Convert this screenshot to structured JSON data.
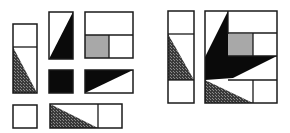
{
  "colors": {
    "background": "#ffffff",
    "stroke": "#1a1a1a",
    "black": "#0a0a0a",
    "gray": "#a8a8a8",
    "hatch_dark": "#3a3a3a",
    "hatch_light": "#8a8a8a"
  },
  "left_panel": {
    "label": "puzzle-pieces",
    "pieces": [
      {
        "name": "tall-piece-hatched",
        "x": 13,
        "y": 24,
        "w": 24,
        "h": 69,
        "dividers": [
          [
            13,
            47,
            37,
            47
          ]
        ],
        "fills": [
          {
            "type": "hatch",
            "points": [
              [
                13,
                47
              ],
              [
                37,
                93
              ],
              [
                13,
                93
              ]
            ]
          }
        ]
      },
      {
        "name": "piece-black-triangle-right",
        "x": 49,
        "y": 12,
        "w": 24,
        "h": 47,
        "dividers": [],
        "fills": [
          {
            "type": "black",
            "points": [
              [
                73,
                12
              ],
              [
                73,
                59
              ],
              [
                49,
                59
              ]
            ]
          }
        ]
      },
      {
        "name": "piece-gray-square",
        "x": 85,
        "y": 12,
        "w": 48,
        "h": 46,
        "dividers": [
          [
            85,
            35,
            133,
            35
          ],
          [
            109,
            35,
            109,
            58
          ]
        ],
        "fills": [
          {
            "type": "gray",
            "points": [
              [
                85,
                35
              ],
              [
                109,
                35
              ],
              [
                109,
                58
              ],
              [
                85,
                58
              ]
            ]
          }
        ]
      },
      {
        "name": "piece-black-square",
        "x": 49,
        "y": 70,
        "w": 24,
        "h": 23,
        "dividers": [],
        "fills": [
          {
            "type": "black",
            "points": [
              [
                49,
                70
              ],
              [
                73,
                70
              ],
              [
                73,
                93
              ],
              [
                49,
                93
              ]
            ]
          }
        ]
      },
      {
        "name": "piece-black-triangle-top",
        "x": 85,
        "y": 70,
        "w": 48,
        "h": 23,
        "dividers": [],
        "fills": [
          {
            "type": "black",
            "points": [
              [
                85,
                70
              ],
              [
                133,
                70
              ],
              [
                85,
                93
              ]
            ]
          }
        ]
      },
      {
        "name": "piece-small-square",
        "x": 13,
        "y": 105,
        "w": 24,
        "h": 23,
        "dividers": [],
        "fills": []
      },
      {
        "name": "piece-bottom-hatched",
        "x": 50,
        "y": 104,
        "w": 72,
        "h": 24,
        "dividers": [
          [
            98,
            104,
            98,
            128
          ]
        ],
        "fills": [
          {
            "type": "hatch",
            "points": [
              [
                50,
                104
              ],
              [
                98,
                128
              ],
              [
                50,
                128
              ]
            ]
          }
        ]
      }
    ]
  },
  "right_panel": {
    "label": "assembled-pieces",
    "pieces": [
      {
        "name": "assembled-tall-piece",
        "x": 168,
        "y": 11,
        "w": 26,
        "h": 92,
        "dividers": [
          [
            168,
            34,
            194,
            34
          ],
          [
            168,
            80,
            194,
            80
          ]
        ],
        "fills": [
          {
            "type": "hatch",
            "points": [
              [
                168,
                34
              ],
              [
                194,
                80
              ],
              [
                168,
                80
              ]
            ]
          }
        ]
      },
      {
        "name": "assembled-square",
        "x": 205,
        "y": 11,
        "w": 72,
        "h": 92,
        "dividers": [
          [
            228,
            11,
            228,
            34
          ],
          [
            228,
            33,
            277,
            33
          ],
          [
            253,
            33,
            253,
            56
          ],
          [
            228,
            56,
            277,
            56
          ],
          [
            228,
            80,
            277,
            80
          ],
          [
            253,
            80,
            253,
            103
          ]
        ],
        "fills": [
          {
            "type": "gray",
            "points": [
              [
                228,
                34
              ],
              [
                253,
                34
              ],
              [
                253,
                56
              ],
              [
                228,
                56
              ]
            ]
          },
          {
            "type": "black",
            "points": [
              [
                228,
                11
              ],
              [
                228,
                56
              ],
              [
                277,
                56
              ],
              [
                233,
                78
              ],
              [
                205,
                80
              ],
              [
                205,
                57
              ]
            ]
          },
          {
            "type": "hatch",
            "points": [
              [
                205,
                80
              ],
              [
                253,
                103
              ],
              [
                205,
                103
              ]
            ]
          }
        ]
      }
    ]
  }
}
